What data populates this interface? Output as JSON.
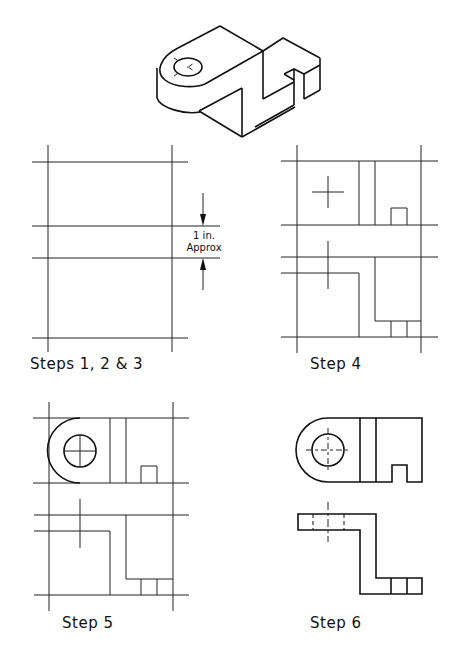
{
  "figure": {
    "isometric": {
      "name": "isometric-part-view"
    },
    "panels": [
      {
        "id": "steps-1-2-3",
        "label": "Steps 1, 2 & 3"
      },
      {
        "id": "step-4",
        "label": "Step 4"
      },
      {
        "id": "step-5",
        "label": "Step 5"
      },
      {
        "id": "step-6",
        "label": "Step 6"
      }
    ],
    "dimension_note": {
      "line1": "1 in.",
      "line2": "Approx"
    }
  },
  "colors": {
    "line": "#222222",
    "background": "#ffffff"
  }
}
